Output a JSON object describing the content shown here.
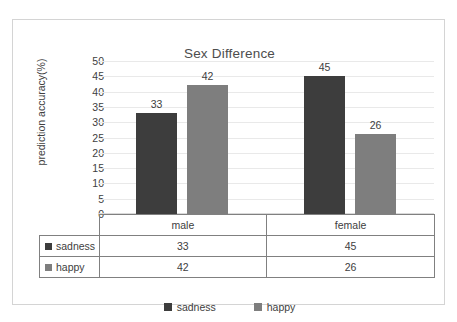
{
  "chart_data": {
    "type": "bar",
    "title": "Sex Difference",
    "xlabel": "",
    "ylabel": "prediction accuracy(%)",
    "categories": [
      "male",
      "female"
    ],
    "series": [
      {
        "name": "sadness",
        "values": [
          33,
          45
        ],
        "color": "#3d3d3d"
      },
      {
        "name": "happy",
        "values": [
          42,
          26
        ],
        "color": "#7e7e7e"
      }
    ],
    "ylim": [
      0,
      50
    ],
    "ytick_step": 5,
    "yticks": [
      50,
      45,
      40,
      35,
      30,
      25,
      20,
      15,
      10,
      5,
      0
    ],
    "grid": true,
    "legend_position": "bottom",
    "data_labels": [
      33,
      42,
      45,
      26
    ],
    "data_table_shown": true
  },
  "legend": {
    "items": [
      {
        "label": "sadness",
        "swatch": "dark-square-icon"
      },
      {
        "label": "happy",
        "swatch": "gray-square-icon"
      }
    ]
  },
  "table": {
    "header_blank": "",
    "columns": [
      "male",
      "female"
    ],
    "rows": [
      {
        "label": "sadness",
        "values": [
          "33",
          "45"
        ]
      },
      {
        "label": "happy",
        "values": [
          "42",
          "26"
        ]
      }
    ]
  }
}
